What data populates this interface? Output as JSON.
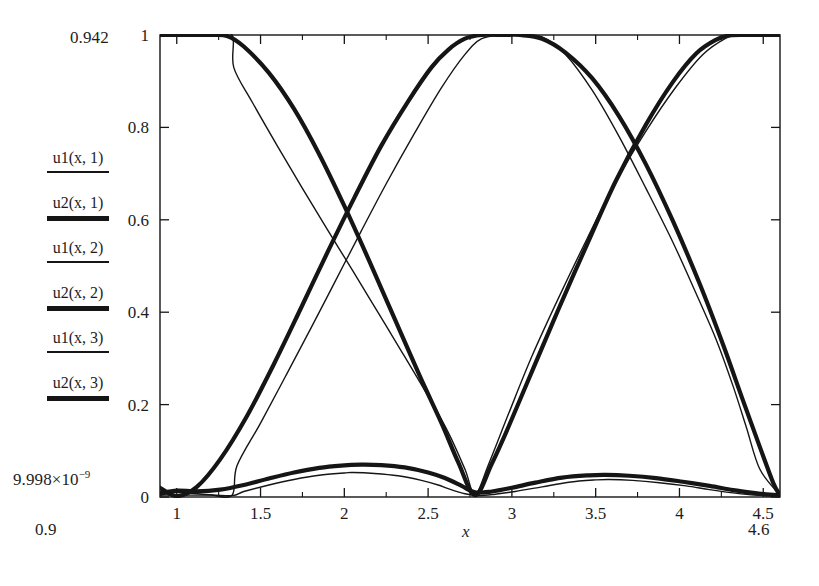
{
  "figure": {
    "background": "#ffffff",
    "ink_color": "#151515",
    "frame": {
      "left": 160,
      "right": 780,
      "top": 35,
      "bottom": 497
    }
  },
  "labels": {
    "y_range_max": "0.942",
    "y_range_min_mantissa": "9.998×10",
    "y_range_min_exponent": "−9",
    "x_range_min": "0.9",
    "x_range_max": "4.6",
    "x_axis_label": "x"
  },
  "legend": {
    "entries": [
      {
        "label": "u1(x, 1)",
        "weight": "thin",
        "sample": "line-sample-thin"
      },
      {
        "label": "u2(x, 1)",
        "weight": "thick",
        "sample": "line-sample-thick"
      },
      {
        "label": "u1(x, 2)",
        "weight": "thin",
        "sample": "line-sample-thin"
      },
      {
        "label": "u2(x, 2)",
        "weight": "thick",
        "sample": "line-sample-thick"
      },
      {
        "label": "u1(x, 3)",
        "weight": "thin",
        "sample": "line-sample-thin"
      },
      {
        "label": "u2(x, 3)",
        "weight": "thick",
        "sample": "line-sample-thick"
      }
    ]
  },
  "chart_data": {
    "type": "line",
    "title": "",
    "xlabel": "x",
    "ylabel": "",
    "xlim": [
      0.9,
      4.6
    ],
    "ylim": [
      0,
      1
    ],
    "y_display_range": [
      "9.998e-9",
      "0.942"
    ],
    "grid": false,
    "legend_position": "left-outside",
    "xticks": [
      1,
      1.5,
      2,
      2.5,
      3,
      3.5,
      4,
      4.5
    ],
    "xticklabels": [
      "1",
      "1.5",
      "2",
      "2.5",
      "3",
      "3.5",
      "4",
      "4.5"
    ],
    "yticks": [
      0,
      0.2,
      0.4,
      0.6,
      0.8,
      1
    ],
    "yticklabels": [
      "0",
      "0.2",
      "0.4",
      "0.6",
      "0.8",
      "1"
    ],
    "minor_xticks": [
      1.25,
      1.75,
      2.25,
      2.75,
      3.25,
      3.75,
      4.25
    ],
    "series": [
      {
        "name": "u1(x, 1)",
        "weight": "thin",
        "description": "Thin descending/oscillating curve: starts at 1 near x=0.9, plateau to ~1.33, falls to 0 near x=2.78, rises to 1 at ~4.35, flat to 4.6",
        "x": [
          0.9,
          1.0,
          1.1,
          1.2,
          1.33,
          1.34,
          1.45,
          1.6,
          1.75,
          1.9,
          2.05,
          2.2,
          2.35,
          2.5,
          2.62,
          2.72,
          2.78,
          2.86,
          2.98,
          3.12,
          3.28,
          3.45,
          3.62,
          3.8,
          3.98,
          4.14,
          4.28,
          4.35,
          4.45,
          4.6
        ],
        "y": [
          1.0,
          1.0,
          1.0,
          1.0,
          1.0,
          0.93,
          0.855,
          0.76,
          0.668,
          0.578,
          0.49,
          0.4,
          0.31,
          0.218,
          0.14,
          0.06,
          0.005,
          0.07,
          0.18,
          0.305,
          0.432,
          0.56,
          0.682,
          0.792,
          0.888,
          0.958,
          0.994,
          1.0,
          1.0,
          1.0
        ]
      },
      {
        "name": "u2(x, 1)",
        "weight": "thick",
        "description": "Thick cosine-like curve: flat at 1 until ~1.30, smoothly decays to 0 at x=2.78, rises smoothly to 1 at ~4.30, flat after",
        "x": [
          0.9,
          1.05,
          1.2,
          1.3,
          1.4,
          1.55,
          1.7,
          1.85,
          2.0,
          2.15,
          2.3,
          2.45,
          2.58,
          2.68,
          2.78,
          2.88,
          2.98,
          3.12,
          3.28,
          3.45,
          3.62,
          3.8,
          3.96,
          4.1,
          4.22,
          4.3,
          4.42,
          4.6
        ],
        "y": [
          1.0,
          1.0,
          1.0,
          0.998,
          0.975,
          0.918,
          0.84,
          0.742,
          0.63,
          0.51,
          0.386,
          0.262,
          0.16,
          0.075,
          0.004,
          0.072,
          0.152,
          0.272,
          0.408,
          0.548,
          0.684,
          0.806,
          0.898,
          0.96,
          0.99,
          0.999,
          1.0,
          1.0
        ]
      },
      {
        "name": "u1(x, 2)",
        "weight": "thin",
        "description": "Thin ascending/oscillating curve: near 0 at left, rises to 1 at ~2.78-3.0, falls back to 0 near 4.35",
        "x": [
          0.9,
          1.05,
          1.2,
          1.33,
          1.36,
          1.5,
          1.65,
          1.8,
          1.95,
          2.1,
          2.25,
          2.42,
          2.58,
          2.72,
          2.82,
          2.95,
          3.05,
          3.18,
          3.32,
          3.48,
          3.64,
          3.8,
          3.96,
          4.1,
          4.22,
          4.32,
          4.4,
          4.48,
          4.6
        ],
        "y": [
          0.004,
          0.004,
          0.004,
          0.004,
          0.068,
          0.16,
          0.262,
          0.365,
          0.47,
          0.575,
          0.678,
          0.788,
          0.886,
          0.958,
          0.992,
          1.0,
          1.0,
          0.996,
          0.958,
          0.88,
          0.78,
          0.668,
          0.552,
          0.44,
          0.34,
          0.24,
          0.15,
          0.06,
          0.004
        ]
      },
      {
        "name": "u2(x, 2)",
        "weight": "thick",
        "description": "Thick ascending cosine curve: 0 near x=0.95, rises to 1 plateau 2.6-3.05, descends to 0 at ~4.45",
        "x": [
          0.9,
          1.0,
          1.12,
          1.26,
          1.42,
          1.58,
          1.74,
          1.9,
          2.06,
          2.22,
          2.38,
          2.52,
          2.62,
          2.72,
          2.82,
          2.95,
          3.05,
          3.18,
          3.32,
          3.48,
          3.64,
          3.8,
          3.96,
          4.12,
          4.26,
          4.38,
          4.48,
          4.56,
          4.6
        ],
        "y": [
          0.02,
          0.002,
          0.022,
          0.082,
          0.176,
          0.288,
          0.408,
          0.53,
          0.648,
          0.76,
          0.856,
          0.93,
          0.968,
          0.992,
          1.0,
          1.0,
          1.0,
          0.992,
          0.962,
          0.906,
          0.824,
          0.72,
          0.598,
          0.462,
          0.33,
          0.208,
          0.108,
          0.03,
          0.004
        ]
      },
      {
        "name": "u1(x, 3)",
        "weight": "thin",
        "description": "Thin low-amplitude double bump near zero: peak ~0.053 at x≈2.05, second peak ~0.038 at x≈3.55",
        "x": [
          0.9,
          1.0,
          1.15,
          1.33,
          1.4,
          1.55,
          1.7,
          1.85,
          2.0,
          2.05,
          2.18,
          2.32,
          2.46,
          2.56,
          2.62,
          2.72,
          2.8,
          2.9,
          3.02,
          3.18,
          3.34,
          3.5,
          3.58,
          3.72,
          3.88,
          4.04,
          4.18,
          4.32,
          4.45,
          4.6
        ],
        "y": [
          0.004,
          0.01,
          0.006,
          0.003,
          0.012,
          0.026,
          0.038,
          0.047,
          0.052,
          0.053,
          0.051,
          0.046,
          0.036,
          0.026,
          0.018,
          0.007,
          0.003,
          0.006,
          0.012,
          0.022,
          0.032,
          0.037,
          0.038,
          0.036,
          0.031,
          0.024,
          0.016,
          0.009,
          0.004,
          0.002
        ]
      },
      {
        "name": "u2(x, 3)",
        "weight": "thick",
        "description": "Thick low-amplitude double bump near zero: peak ~0.070 at x≈2.10, second peak ~0.048 at x≈3.55",
        "x": [
          0.9,
          1.0,
          1.12,
          1.26,
          1.4,
          1.55,
          1.7,
          1.85,
          1.98,
          2.1,
          2.22,
          2.36,
          2.5,
          2.6,
          2.7,
          2.78,
          2.88,
          3.0,
          3.14,
          3.3,
          3.46,
          3.56,
          3.7,
          3.86,
          4.02,
          4.18,
          4.32,
          4.44,
          4.54,
          4.6
        ],
        "y": [
          0.008,
          0.014,
          0.012,
          0.016,
          0.026,
          0.04,
          0.053,
          0.063,
          0.068,
          0.07,
          0.069,
          0.064,
          0.053,
          0.041,
          0.024,
          0.01,
          0.012,
          0.02,
          0.031,
          0.042,
          0.047,
          0.048,
          0.046,
          0.041,
          0.033,
          0.024,
          0.015,
          0.009,
          0.005,
          0.004
        ]
      }
    ]
  }
}
